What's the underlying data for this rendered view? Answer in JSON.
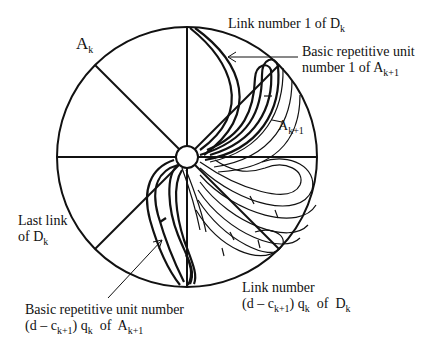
{
  "diagram": {
    "type": "circular sector diagram with spiral repetitive units",
    "colors": {
      "stroke": "#111111",
      "background": "#ffffff"
    },
    "circle": {
      "cx": 187,
      "cy": 157,
      "r": 130
    },
    "hub": {
      "cx": 187,
      "cy": 157,
      "r": 11
    },
    "spokes": 8,
    "labels": {
      "ak": {
        "main": "A",
        "sub": "k"
      },
      "ak1_inner": {
        "main": "A",
        "sub": "k+1"
      },
      "link1": {
        "text": "Link number 1 of",
        "D": "D",
        "sub": "k"
      },
      "unit1": {
        "line1": "Basic repetitive unit",
        "line2": "number 1 of",
        "A": "A",
        "sub": "k+1"
      },
      "lastlink": {
        "line1": "Last link",
        "line2": "of",
        "D": "D",
        "sub": "k"
      },
      "unitlast": {
        "line1": "Basic repetitive unit number",
        "pre": "(d – c",
        "csub": "k+1",
        "mid": ") q",
        "qsub": "k",
        "of": "of",
        "A": "A",
        "sub": "k+1"
      },
      "linklast": {
        "line1": "Link number",
        "pre": "(d – c",
        "csub": "k+1",
        "mid": ") q",
        "qsub": "k",
        "of": "of",
        "D": "D",
        "sub": "k"
      }
    }
  }
}
